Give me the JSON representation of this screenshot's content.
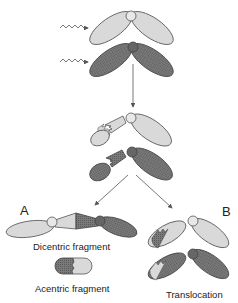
{
  "diagram": {
    "steps": [
      "irradiation",
      "breakage",
      "rejoining"
    ],
    "labels": {
      "panel_a": "A",
      "panel_b": "B",
      "dicentric": "Dicentric fragment",
      "acentric": "Acentric fragment",
      "translocation": "Translocation"
    },
    "colors": {
      "light_chromosome": "#d9d9d9",
      "dark_chromosome": "#6e6e6e",
      "outline": "#555555",
      "arrow": "#555555"
    }
  }
}
